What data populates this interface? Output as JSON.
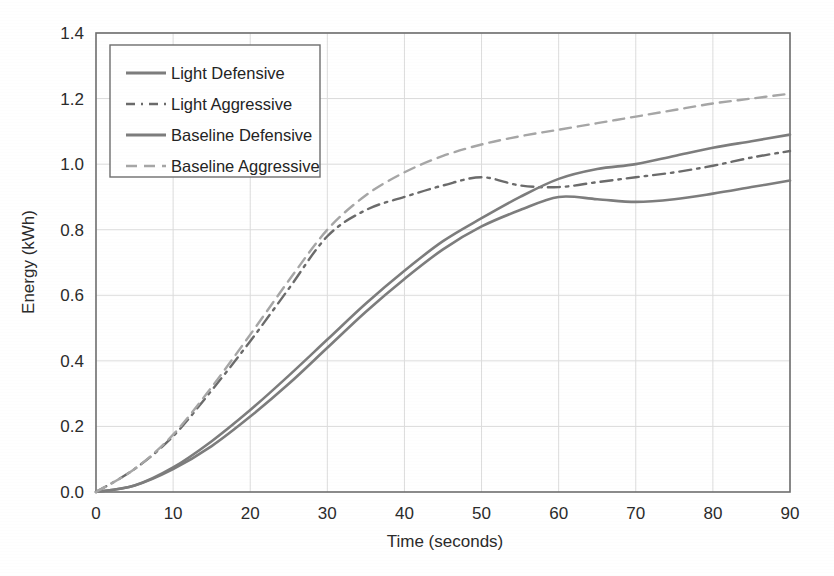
{
  "chart_data": {
    "type": "line",
    "title": "",
    "xlabel": "Time (seconds)",
    "ylabel": "Energy (kWh)",
    "xlim": [
      0,
      90
    ],
    "ylim": [
      0.0,
      1.4
    ],
    "xticks": [
      "0",
      "10",
      "20",
      "30",
      "40",
      "50",
      "60",
      "70",
      "80",
      "90"
    ],
    "yticks": [
      "0.0",
      "0.2",
      "0.4",
      "0.6",
      "0.8",
      "1.0",
      "1.2",
      "1.4"
    ],
    "grid": true,
    "legend_position": "upper-left",
    "x": [
      0,
      5,
      10,
      15,
      20,
      25,
      30,
      35,
      40,
      45,
      50,
      55,
      60,
      65,
      70,
      75,
      80,
      85,
      90
    ],
    "series": [
      {
        "name": "Light Defensive",
        "style": "solid",
        "color": "#7d7d7d",
        "values": [
          0.0,
          0.02,
          0.07,
          0.14,
          0.23,
          0.33,
          0.44,
          0.55,
          0.65,
          0.74,
          0.81,
          0.86,
          0.9,
          0.893,
          0.885,
          0.893,
          0.91,
          0.93,
          0.95
        ]
      },
      {
        "name": "Light Aggressive",
        "style": "dash-dot",
        "color": "#6b6b6b",
        "values": [
          0.0,
          0.07,
          0.17,
          0.31,
          0.46,
          0.62,
          0.78,
          0.86,
          0.9,
          0.935,
          0.96,
          0.935,
          0.93,
          0.945,
          0.96,
          0.975,
          0.995,
          1.02,
          1.04
        ]
      },
      {
        "name": "Baseline Defensive",
        "style": "solid",
        "color": "#7d7d7d",
        "values": [
          0.0,
          0.02,
          0.075,
          0.155,
          0.25,
          0.355,
          0.465,
          0.575,
          0.675,
          0.765,
          0.835,
          0.9,
          0.955,
          0.985,
          1.0,
          1.025,
          1.05,
          1.07,
          1.09
        ]
      },
      {
        "name": "Baseline Aggressive",
        "style": "dashed",
        "color": "#a6a6a6",
        "values": [
          0.0,
          0.07,
          0.175,
          0.32,
          0.48,
          0.645,
          0.8,
          0.905,
          0.975,
          1.025,
          1.06,
          1.085,
          1.105,
          1.125,
          1.145,
          1.165,
          1.185,
          1.2,
          1.215
        ]
      }
    ]
  },
  "legend": {
    "items": [
      {
        "label": "Light Defensive"
      },
      {
        "label": "Light Aggressive"
      },
      {
        "label": "Baseline Defensive"
      },
      {
        "label": "Baseline Aggressive"
      }
    ]
  }
}
